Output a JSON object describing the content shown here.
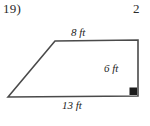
{
  "worksheet": {
    "problem_number": "19)",
    "next_problem_number_partial": "2"
  },
  "figure": {
    "shape_name": "trapezoid",
    "labels": {
      "top_side": "8 ft",
      "right_side": "6 ft",
      "bottom_side": "13 ft"
    },
    "right_angle_marker": "right-angle at bottom-right vertex",
    "stroke_color": "#4a4a4a",
    "text_color": "#232323",
    "background_color": "#ffffff",
    "vertices": {
      "bottom_left": [
        8,
        97
      ],
      "top_left": [
        55,
        41
      ],
      "top_right": [
        138,
        40
      ],
      "bottom_right": [
        138,
        96
      ]
    }
  }
}
